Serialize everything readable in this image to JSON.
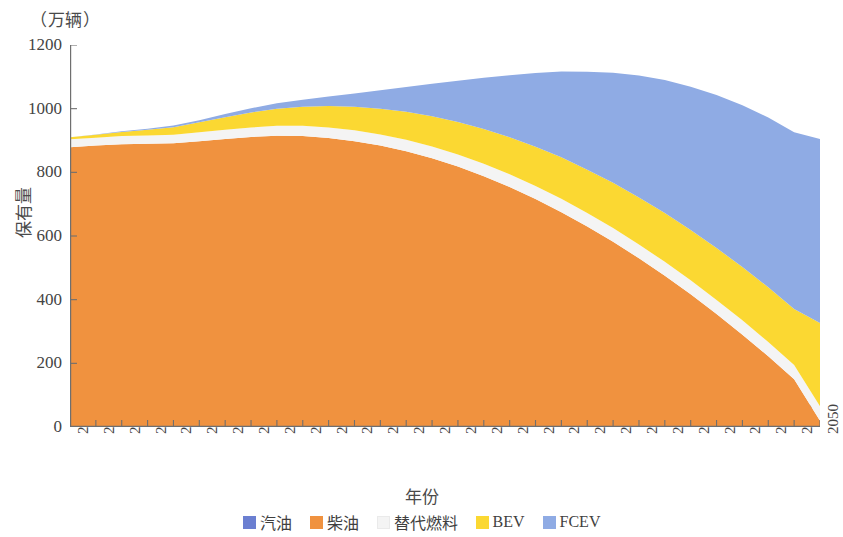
{
  "unit_label": "（万辆）",
  "axis": {
    "y_title": "保有量",
    "x_title": "年份"
  },
  "legend": {
    "items": [
      {
        "label": "汽油",
        "color": "#6b7fd1"
      },
      {
        "label": "柴油",
        "color": "#f0923f"
      },
      {
        "label": "替代燃料",
        "color": "#f4f4f4"
      },
      {
        "label": "BEV",
        "color": "#fbd832"
      },
      {
        "label": "FCEV",
        "color": "#8fabe4"
      }
    ]
  },
  "chart_data": {
    "type": "area",
    "stacked": true,
    "title": "",
    "subtitle": "",
    "xlabel": "年份",
    "ylabel": "保有量",
    "unit": "万辆",
    "grid": false,
    "legend_position": "bottom",
    "ylim": [
      0,
      1200
    ],
    "yticks": [
      0,
      200,
      400,
      600,
      800,
      1000,
      1200
    ],
    "ytick_labels": [
      "0",
      "200",
      "400",
      "600",
      "800",
      "1000",
      "1200"
    ],
    "x": [
      2021,
      2022,
      2023,
      2024,
      2025,
      2026,
      2027,
      2028,
      2029,
      2030,
      2031,
      2032,
      2033,
      2034,
      2035,
      2036,
      2037,
      2038,
      2039,
      2040,
      2041,
      2042,
      2043,
      2044,
      2045,
      2046,
      2047,
      2048,
      2049,
      2050
    ],
    "xtick_labels": [
      "2021",
      "2022",
      "2023",
      "2024",
      "2025",
      "2026",
      "2027",
      "2028",
      "2029",
      "2030",
      "2031",
      "2032",
      "2033",
      "2034",
      "2035",
      "2036",
      "2037",
      "2038",
      "2039",
      "2040",
      "2041",
      "2042",
      "2043",
      "2044",
      "2045",
      "2046",
      "2047",
      "2048",
      "2049",
      "2050"
    ],
    "series": [
      {
        "name": "汽油",
        "color": "#6b7fd1",
        "values": [
          0,
          0,
          0,
          0,
          0,
          0,
          0,
          0,
          0,
          0,
          0,
          0,
          0,
          0,
          0,
          0,
          0,
          0,
          0,
          0,
          0,
          0,
          0,
          0,
          0,
          0,
          0,
          0,
          0,
          0
        ]
      },
      {
        "name": "柴油",
        "color": "#f0923f",
        "values": [
          879,
          884,
          888,
          890,
          891,
          898,
          905,
          911,
          915,
          914,
          908,
          898,
          884,
          866,
          844,
          818,
          788,
          754,
          716,
          675,
          630,
          582,
          530,
          475,
          417,
          355,
          290,
          222,
          150,
          20
        ]
      },
      {
        "name": "替代燃料",
        "color": "#f4f4f4",
        "values": [
          25,
          25,
          26,
          26,
          27,
          28,
          29,
          30,
          31,
          32,
          33,
          34,
          35,
          36,
          37,
          38,
          39,
          40,
          41,
          42,
          42,
          43,
          43,
          44,
          44,
          44,
          45,
          45,
          45,
          45
        ]
      },
      {
        "name": "BEV",
        "color": "#fbd832",
        "values": [
          6,
          9,
          13,
          18,
          24,
          31,
          39,
          47,
          54,
          60,
          67,
          74,
          81,
          88,
          95,
          102,
          109,
          116,
          123,
          130,
          136,
          142,
          148,
          153,
          158,
          163,
          168,
          172,
          176,
          262
        ]
      },
      {
        "name": "FCEV",
        "color": "#8fabe4",
        "values": [
          0,
          1,
          2,
          3,
          5,
          7,
          10,
          13,
          17,
          22,
          30,
          42,
          58,
          78,
          102,
          130,
          161,
          195,
          232,
          270,
          308,
          346,
          383,
          418,
          450,
          481,
          508,
          533,
          555,
          578
        ]
      }
    ]
  }
}
